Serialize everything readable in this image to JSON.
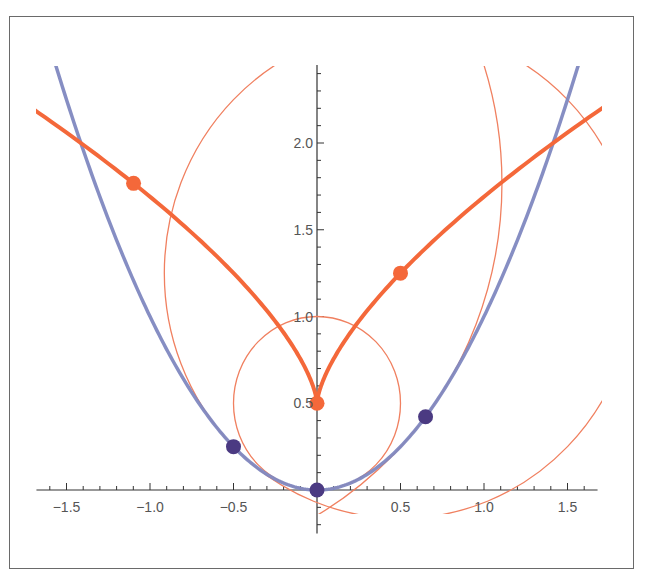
{
  "chart_data": {
    "type": "line",
    "title": "",
    "xlabel": "",
    "ylabel": "",
    "xlim": [
      -1.68,
      1.68
    ],
    "ylim": [
      -0.25,
      2.45
    ],
    "grid": false,
    "legend": null,
    "x_ticks": [
      -1.5,
      -1.0,
      -0.5,
      0.5,
      1.0,
      1.5
    ],
    "x_tick_labels": [
      "-1.5",
      "-1.0",
      "-0.5",
      "0.5",
      "1.0",
      "1.5"
    ],
    "y_ticks": [
      0.5,
      1.0,
      1.5,
      2.0
    ],
    "y_tick_labels": [
      "0.5",
      "1.0",
      "1.5",
      "2.0"
    ],
    "series": [
      {
        "name": "parabola",
        "description": "y = x^2",
        "color": "#8088c0",
        "stroke_width": 3.5,
        "t_range": [
          -1.62,
          1.62
        ],
        "parametric": {
          "x": "t",
          "y": "t^2"
        }
      },
      {
        "name": "evolute",
        "description": "evolute of parabola: x = -4t^3, y = 1/2 + 3t^2",
        "color": "#f4683a",
        "stroke_width": 4,
        "t_range": [
          -0.76,
          0.76
        ],
        "parametric": {
          "x": "-4t^3",
          "y": "0.5 + 3t^2"
        }
      }
    ],
    "points_on_curve": [
      {
        "t": -0.5,
        "x": -0.5,
        "y": 0.25,
        "color": "#4b3a82"
      },
      {
        "t": 0.0,
        "x": 0.0,
        "y": 0.0,
        "color": "#4b3a82"
      },
      {
        "t": 0.65,
        "x": 0.65,
        "y": 0.4225,
        "color": "#4b3a82"
      }
    ],
    "centers_of_curvature": [
      {
        "t": -0.5,
        "x": 0.5,
        "y": 1.25,
        "color": "#f4683a"
      },
      {
        "t": 0.0,
        "x": 0.0,
        "y": 0.5,
        "color": "#f4683a"
      },
      {
        "t": 0.65,
        "x": -1.0985,
        "y": 1.7675,
        "color": "#f4683a"
      }
    ],
    "osculating_circles": [
      {
        "t": -0.5,
        "cx": 0.5,
        "cy": 1.25,
        "r": 1.4142,
        "color": "#f08060"
      },
      {
        "t": 0.0,
        "cx": 0.0,
        "cy": 0.5,
        "r": 0.5,
        "color": "#f08060"
      },
      {
        "t": 0.65,
        "cx": -1.0985,
        "cy": 1.7675,
        "r": 2.206,
        "color": "#f08060"
      }
    ]
  },
  "layout": {
    "origin_px": [
      317,
      490
    ],
    "px_per_unit_x": 167,
    "px_per_unit_y": 173.5,
    "clip": {
      "x": 36,
      "y": 66,
      "w": 566,
      "h": 448
    },
    "minor_tick_step": 0.1
  }
}
